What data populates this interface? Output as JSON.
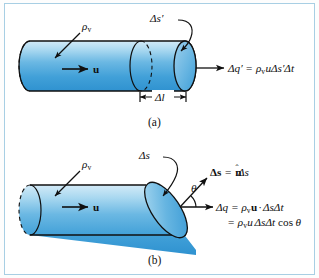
{
  "figure": {
    "border_color": "#a8cfe4",
    "cylinder_colors": {
      "light": "#bfe0f2",
      "mid": "#5fb2e0",
      "deep": "#2f92d0",
      "cap": "#7cc1e6",
      "outline": "#101010"
    }
  },
  "panels": [
    {
      "id": "a",
      "caption": "(a)",
      "labels": {
        "density": "ρ",
        "density_sub": "v",
        "velocity": "u",
        "area": "Δs′",
        "length": "Δl"
      },
      "equation": {
        "lhs": "Δq′",
        "equals": "=",
        "rhs_rho": "ρ",
        "rhs_rho_sub": "v",
        "rhs_u": "u",
        "rhs_area": "Δs′",
        "rhs_time": "Δt",
        "full": "Δq′ = ρᵥ u Δs′ Δt"
      }
    },
    {
      "id": "b",
      "caption": "(b)",
      "labels": {
        "density": "ρ",
        "density_sub": "v",
        "velocity": "u",
        "area": "Δs",
        "angle": "θ"
      },
      "vector_equation": {
        "lhs": "Δs",
        "equals": "=",
        "normal": "n",
        "rhs_area": "Δs",
        "full": "Δs = n̂Δs"
      },
      "equation_line1": {
        "lhs": "Δq",
        "equals": "=",
        "rho": "ρ",
        "rho_sub": "v",
        "u_bold": "u",
        "dot": "·",
        "area": "Δs",
        "time": "Δt",
        "full": "Δq = ρᵥ u · ΔsΔt"
      },
      "equation_line2": {
        "equals": "=",
        "rho": "ρ",
        "rho_sub": "v",
        "u": "u",
        "area": "Δs",
        "time": "Δt",
        "cos": "cos",
        "angle": "θ",
        "full": "= ρᵥ u ΔsΔt cos θ"
      }
    }
  ]
}
